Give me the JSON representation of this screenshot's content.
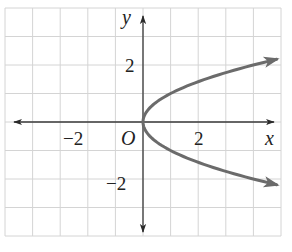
{
  "chart_data": {
    "type": "line",
    "title": "",
    "equation": "x = y^2",
    "xlabel": "x",
    "ylabel": "y",
    "origin_label": "O",
    "xlim": [
      -5,
      5
    ],
    "ylim": [
      -4,
      4
    ],
    "grid": true,
    "x_tick_labels": [
      {
        "value": -2,
        "label": "−2"
      },
      {
        "value": 2,
        "label": "2"
      }
    ],
    "y_tick_labels": [
      {
        "value": 2,
        "label": "2"
      },
      {
        "value": -2,
        "label": "−2"
      }
    ],
    "series": [
      {
        "name": "x = y^2",
        "points": [
          {
            "x": 4.84,
            "y": -2.2
          },
          {
            "x": 4.0,
            "y": -2.0
          },
          {
            "x": 2.25,
            "y": -1.5
          },
          {
            "x": 1.0,
            "y": -1.0
          },
          {
            "x": 0.25,
            "y": -0.5
          },
          {
            "x": 0.0,
            "y": 0.0
          },
          {
            "x": 0.25,
            "y": 0.5
          },
          {
            "x": 1.0,
            "y": 1.0
          },
          {
            "x": 2.25,
            "y": 1.5
          },
          {
            "x": 4.0,
            "y": 2.0
          },
          {
            "x": 4.84,
            "y": 2.2
          }
        ],
        "arrow_both_ends": true
      }
    ]
  },
  "colors": {
    "grid": "#d4d4d4",
    "axis": "#3a3a3a",
    "curve": "#6b6b6b",
    "text": "#222222"
  },
  "labels": {
    "x_axis_var": "x",
    "y_axis_var": "y",
    "origin": "O",
    "x_neg2": "−2",
    "x_pos2": "2",
    "y_pos2": "2",
    "y_neg2": "−2"
  }
}
